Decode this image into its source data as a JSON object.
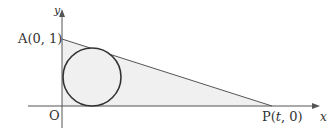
{
  "diagram": {
    "axis_labels": {
      "x": "x",
      "y": "y"
    },
    "origin_label": "O",
    "point_a": {
      "name": "A",
      "coords": "(0, 1)",
      "label": "A(0, 1)"
    },
    "point_p": {
      "name": "P",
      "label_prefix": "P(",
      "param": "t",
      "label_suffix": ", 0)"
    },
    "shape": "triangle OAP with inscribed circle",
    "colors": {
      "fill": "#f0f0f0",
      "stroke": "#333333",
      "axis": "#555555"
    }
  }
}
